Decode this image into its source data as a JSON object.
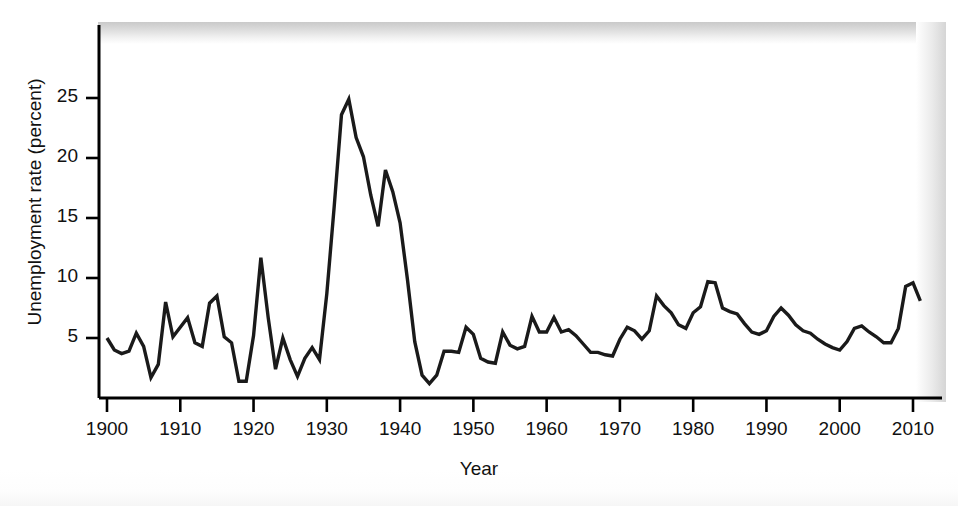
{
  "chart_data": {
    "type": "line",
    "title": "",
    "xlabel": "Year",
    "ylabel": "Unemployment rate (percent)",
    "xlim": [
      1900,
      2013
    ],
    "ylim": [
      0,
      29
    ],
    "grid": false,
    "legend": "none",
    "line_color": "#1a1a1a",
    "axis_color": "#000000",
    "background": "#ffffff",
    "xticks": [
      1900,
      1910,
      1920,
      1930,
      1940,
      1950,
      1960,
      1970,
      1980,
      1990,
      2000,
      2010
    ],
    "xtick_labels": [
      "1900",
      "1910",
      "1920",
      "1930",
      "1940",
      "1950",
      "1960",
      "1970",
      "1980",
      "1990",
      "2000",
      "2010"
    ],
    "yticks": [
      5,
      10,
      15,
      20,
      25
    ],
    "ytick_labels": [
      "5",
      "10",
      "15",
      "20",
      "25"
    ],
    "series": [
      {
        "name": "Unemployment rate",
        "x": [
          1900,
          1901,
          1902,
          1903,
          1904,
          1905,
          1906,
          1907,
          1908,
          1909,
          1910,
          1911,
          1912,
          1913,
          1914,
          1915,
          1916,
          1917,
          1918,
          1919,
          1920,
          1921,
          1922,
          1923,
          1924,
          1925,
          1926,
          1927,
          1928,
          1929,
          1930,
          1931,
          1932,
          1933,
          1934,
          1935,
          1936,
          1937,
          1938,
          1939,
          1940,
          1941,
          1942,
          1943,
          1944,
          1945,
          1946,
          1947,
          1948,
          1949,
          1950,
          1951,
          1952,
          1953,
          1954,
          1955,
          1956,
          1957,
          1958,
          1959,
          1960,
          1961,
          1962,
          1963,
          1964,
          1965,
          1966,
          1967,
          1968,
          1969,
          1970,
          1971,
          1972,
          1973,
          1974,
          1975,
          1976,
          1977,
          1978,
          1979,
          1980,
          1981,
          1982,
          1983,
          1984,
          1985,
          1986,
          1987,
          1988,
          1989,
          1990,
          1991,
          1992,
          1993,
          1994,
          1995,
          1996,
          1997,
          1998,
          1999,
          2000,
          2001,
          2002,
          2003,
          2004,
          2005,
          2006,
          2007,
          2008,
          2009,
          2010,
          2011
        ],
        "values": [
          5.0,
          4.0,
          3.7,
          3.9,
          5.4,
          4.3,
          1.7,
          2.8,
          8.0,
          5.1,
          5.9,
          6.7,
          4.6,
          4.3,
          7.9,
          8.5,
          5.1,
          4.6,
          1.4,
          1.4,
          5.2,
          11.7,
          6.7,
          2.4,
          5.0,
          3.2,
          1.8,
          3.3,
          4.2,
          3.2,
          8.7,
          15.9,
          23.6,
          24.9,
          21.7,
          20.1,
          16.9,
          14.3,
          19.0,
          17.2,
          14.6,
          9.9,
          4.7,
          1.9,
          1.2,
          1.9,
          3.9,
          3.9,
          3.8,
          5.9,
          5.3,
          3.3,
          3.0,
          2.9,
          5.5,
          4.4,
          4.1,
          4.3,
          6.8,
          5.5,
          5.5,
          6.7,
          5.5,
          5.7,
          5.2,
          4.5,
          3.8,
          3.8,
          3.6,
          3.5,
          4.9,
          5.9,
          5.6,
          4.9,
          5.6,
          8.5,
          7.7,
          7.1,
          6.1,
          5.8,
          7.1,
          7.6,
          9.7,
          9.6,
          7.5,
          7.2,
          7.0,
          6.2,
          5.5,
          5.3,
          5.6,
          6.8,
          7.5,
          6.9,
          6.1,
          5.6,
          5.4,
          4.9,
          4.5,
          4.2,
          4.0,
          4.7,
          5.8,
          6.0,
          5.5,
          5.1,
          4.6,
          4.6,
          5.8,
          9.3,
          9.6,
          8.1
        ]
      }
    ],
    "annotations": [
      "Great Depression peak near 25 percent in 1933",
      "World War II trough near 1 percent in 1944",
      "Post-2008 recession rise to about 9.6 percent in 2010"
    ]
  },
  "axis": {
    "ylabel": "Unemployment rate (percent)",
    "xlabel": "Year"
  }
}
